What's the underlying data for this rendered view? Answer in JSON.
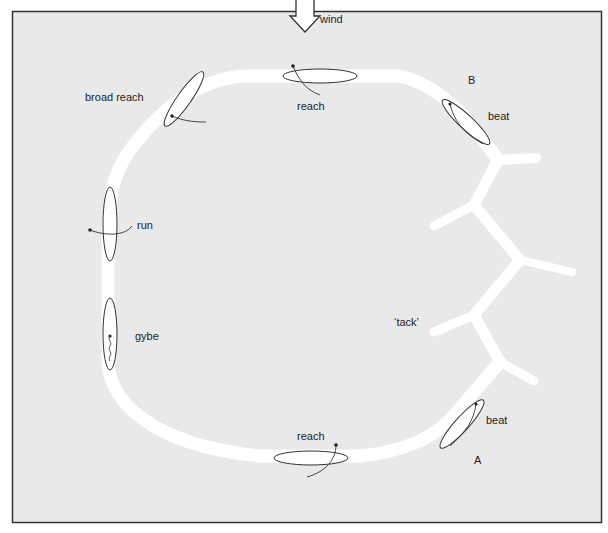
{
  "diagram": {
    "colors": {
      "background": "#e9e9e9",
      "frame": "#333333",
      "track": "#ffffff",
      "sail_outline": "#333333",
      "text": "#222222"
    },
    "wind_label": "wind",
    "labels": {
      "broad_reach": "broad reach",
      "reach_top": "reach",
      "B": "B",
      "beat_top": "beat",
      "run": "run",
      "gybe": "gybe",
      "tack": "‘tack’",
      "beat_bottom": "beat",
      "reach_bottom": "reach",
      "A": "A"
    }
  }
}
